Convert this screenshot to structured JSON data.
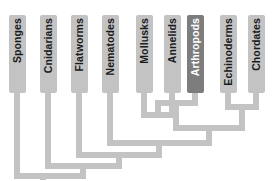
{
  "diagram": {
    "type": "cladogram",
    "colors": {
      "background": "#ffffff",
      "box_default_fill": "#c3c3c3",
      "box_highlight_fill": "#7d7d7d",
      "label_default_color": "#1a1a1a",
      "label_highlight_color": "#ffffff",
      "branch_color": "#c3c3c3"
    },
    "taxa": [
      {
        "id": "sponges",
        "label": "Sponges",
        "highlighted": false
      },
      {
        "id": "cnidarians",
        "label": "Cnidarians",
        "highlighted": false
      },
      {
        "id": "flatworms",
        "label": "Flatworms",
        "highlighted": false
      },
      {
        "id": "nematodes",
        "label": "Nematodes",
        "highlighted": false
      },
      {
        "id": "mollusks",
        "label": "Mollusks",
        "highlighted": false
      },
      {
        "id": "annelids",
        "label": "Annelids",
        "highlighted": false
      },
      {
        "id": "arthropods",
        "label": "Arthropods",
        "highlighted": true
      },
      {
        "id": "echinoderms",
        "label": "Echinoderms",
        "highlighted": false
      },
      {
        "id": "chordates",
        "label": "Chordates",
        "highlighted": false
      }
    ],
    "geometry": {
      "box_width": 17,
      "box_top": 15,
      "box_height": 78,
      "tip_x": [
        17,
        48,
        79,
        110,
        144,
        172,
        195,
        228,
        256
      ],
      "stroke_width": 6,
      "root_x": 43,
      "root_bottom_y": 178
    },
    "nodes": [
      {
        "id": "mollusks-annelids",
        "y": 115,
        "children_x": [
          144,
          172
        ]
      },
      {
        "id": "lophotrochozoa-arthropods",
        "y": 103,
        "children_x": [
          158,
          195
        ]
      },
      {
        "id": "echinoderms-chordates",
        "y": 107,
        "children_x": [
          228,
          256
        ]
      },
      {
        "id": "protostome-clade",
        "y": 128,
        "children_x": [
          176,
          242
        ]
      },
      {
        "id": "bilateria-nematodes",
        "y": 143,
        "children_x": [
          110,
          209
        ]
      },
      {
        "id": "flatworm-clade",
        "y": 155,
        "children_x": [
          79,
          159
        ]
      },
      {
        "id": "cnidarian-clade",
        "y": 166,
        "children_x": [
          48,
          119
        ]
      },
      {
        "id": "root",
        "y": 176,
        "children_x": [
          17,
          83
        ]
      }
    ]
  }
}
